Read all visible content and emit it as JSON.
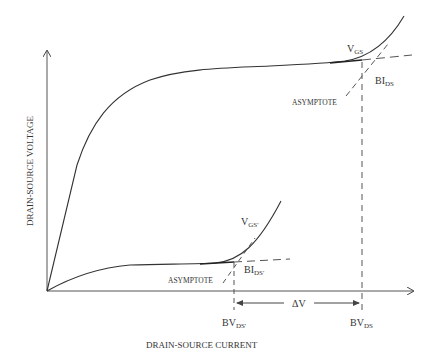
{
  "diagram": {
    "type": "drain-source breakdown characteristic",
    "x_axis_label": "DRAIN-SOURCE CURRENT",
    "y_axis_label": "DRAIN-SOURCE VOLTAGE",
    "upper_curve": {
      "label_main": "V",
      "label_sub": "GS",
      "asymptote_label": "ASYMPTOTE",
      "intercept_main": "BI",
      "intercept_sub": "DS",
      "breakdown_main": "BV",
      "breakdown_sub": "DS"
    },
    "lower_curve": {
      "label_main": "V",
      "label_sub": "GS'",
      "asymptote_label": "ASYMPTOTE",
      "intercept_main": "BI",
      "intercept_sub": "DS'",
      "breakdown_main": "BV",
      "breakdown_sub": "DS'"
    },
    "delta_label": "ΔV",
    "colors": {
      "line": "#333333",
      "dashed": "#555555",
      "background": "#ffffff"
    }
  }
}
